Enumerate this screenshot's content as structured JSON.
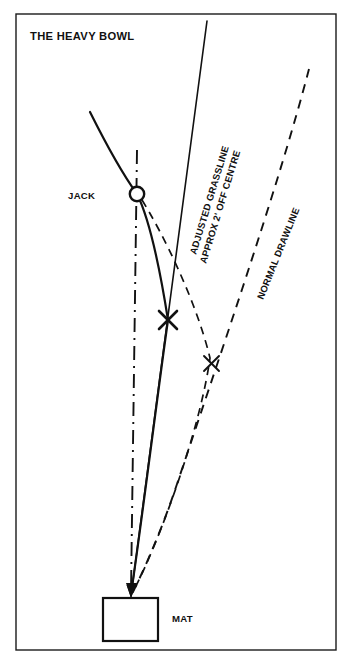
{
  "diagram": {
    "title": "THE HEAVY BOWL",
    "labels": {
      "jack": "JACK",
      "mat": "MAT",
      "adjusted_grassline_line1": "ADJUSTED GRASSLINE",
      "adjusted_grassline_line2": "APPROX 2' OFF CENTRE",
      "normal_drawline": "NORMAL DRAWLINE"
    },
    "colors": {
      "ink": "#111111",
      "frame": "#1a1a1a",
      "paper": "#ffffff"
    },
    "markers": {
      "jack_position": "137,194",
      "bold_cross_position": "168,320",
      "fine_cross_position": "211,363",
      "mat_position": "103,598",
      "delivery_point": "131,597"
    }
  }
}
